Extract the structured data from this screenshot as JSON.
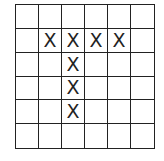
{
  "grid": {
    "rows": 6,
    "cols": 6,
    "mark_symbol": "X",
    "cells": [
      [
        "",
        "",
        "",
        "",
        "",
        ""
      ],
      [
        "",
        "X",
        "X",
        "X",
        "X",
        ""
      ],
      [
        "",
        "",
        "X",
        "",
        "",
        ""
      ],
      [
        "",
        "",
        "X",
        "",
        "",
        ""
      ],
      [
        "",
        "",
        "X",
        "",
        "",
        ""
      ],
      [
        "",
        "",
        "",
        "",
        "",
        ""
      ]
    ]
  }
}
